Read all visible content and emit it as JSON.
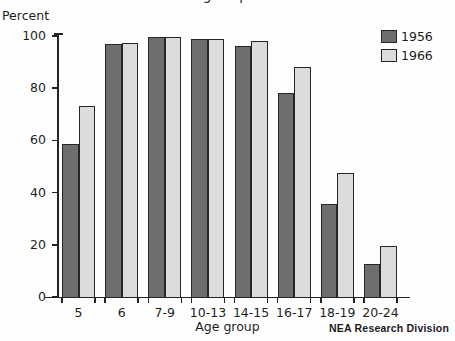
{
  "chart_data": {
    "type": "bar",
    "title": "Percent of Total School-Age Population Enrolled in School",
    "xlabel": "Age group",
    "ylabel": "Percent",
    "ylim": [
      0,
      100
    ],
    "yticks": [
      0,
      20,
      40,
      60,
      80,
      100
    ],
    "ytick_labels": [
      "0",
      "20",
      "40",
      "60",
      "80",
      "100"
    ],
    "grid": false,
    "legend_position": "top-right",
    "categories": [
      "5",
      "6",
      "7-9",
      "10-13",
      "14-15",
      "16-17",
      "18-19",
      "20-24"
    ],
    "series": [
      {
        "name": "1956",
        "color": "#6e6e6e",
        "values": [
          58.5,
          97.0,
          99.5,
          99.0,
          96.0,
          78.0,
          35.5,
          12.5
        ]
      },
      {
        "name": "1966",
        "color": "#dcdcdc",
        "values": [
          73.0,
          97.5,
          99.5,
          99.0,
          98.0,
          88.0,
          47.5,
          19.5
        ]
      }
    ],
    "annotations": [
      {
        "name": "source-note",
        "text": "NEA Research Division"
      }
    ]
  },
  "legend": {
    "entries": [
      {
        "label": "1956"
      },
      {
        "label": "1966"
      }
    ]
  },
  "colors": {
    "series_1956": "#6e6e6e",
    "series_1966": "#dcdcdc",
    "axis": "#232323",
    "outline": "#262626",
    "background": "#fefefe"
  }
}
